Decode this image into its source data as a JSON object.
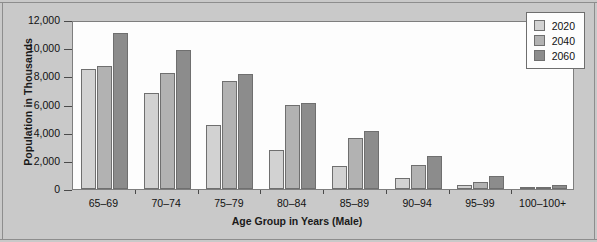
{
  "chart_data": {
    "type": "bar",
    "title": "",
    "xlabel": "Age Group in Years (Male)",
    "ylabel": "Population in Thousands",
    "categories": [
      "65–69",
      "70–74",
      "75–79",
      "80–84",
      "85–89",
      "90–94",
      "95–99",
      "100–100+"
    ],
    "series": [
      {
        "name": "2020",
        "color": "#d2d2d2",
        "values": [
          8500,
          6850,
          4550,
          2800,
          1600,
          800,
          300,
          50
        ]
      },
      {
        "name": "2040",
        "color": "#b2b2b2",
        "values": [
          8700,
          8250,
          7650,
          5950,
          3600,
          1700,
          500,
          100
        ]
      },
      {
        "name": "2060",
        "color": "#8c8c8c",
        "values": [
          11100,
          9850,
          8150,
          6100,
          4100,
          2350,
          950,
          250
        ]
      }
    ],
    "ylim": [
      0,
      12000
    ],
    "ytick_values": [
      0,
      2000,
      4000,
      6000,
      8000,
      10000,
      12000
    ],
    "ytick_labels": [
      "0",
      "2,000",
      "4,000",
      "6,000",
      "8,000",
      "10,000",
      "12,000"
    ],
    "grid": false,
    "legend_position": "top-right"
  }
}
